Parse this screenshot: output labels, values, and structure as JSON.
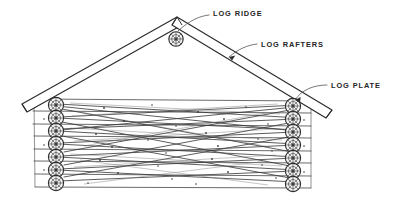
{
  "drawing": {
    "title": "Log cabin gable-end framing sketch",
    "style": "hand-drawn pencil line drawing",
    "background_color": "#ffffff",
    "ink_color": "#2b2b2b"
  },
  "annotations": [
    {
      "id": "log-ridge",
      "label": "LOG RIDGE",
      "text_x": 213,
      "text_y": 13,
      "leader": "M209,15 C200,16 190,20 178,30",
      "points_to": "ridge-log-end"
    },
    {
      "id": "log-rafters",
      "label": "LOG RAFTERS",
      "text_x": 261,
      "text_y": 44,
      "leader": "M257,44 C248,45 238,49 230,56",
      "points_to": "right-rafter",
      "arrow": {
        "x": 229,
        "y": 57,
        "angle": 35
      }
    },
    {
      "id": "log-plate",
      "label": "LOG PLATE",
      "text_x": 331,
      "text_y": 85,
      "leader": "M327,85 C315,85 303,89 296,99",
      "points_to": "right-plate-log-end",
      "arrow": {
        "x": 295,
        "y": 100,
        "angle": 60
      }
    }
  ],
  "structure": {
    "ridge": {
      "apex_x": 178,
      "apex_y": 22
    },
    "rafters": {
      "count": 2,
      "thickness": 9,
      "left_foot": {
        "x": 23,
        "y": 106
      },
      "right_foot": {
        "x": 333,
        "y": 118
      }
    },
    "wall": {
      "left_x": 33,
      "right_x": 311,
      "top_y": 98,
      "bottom_y": 188,
      "log_courses": 7
    },
    "log_ends": {
      "left_count": 7,
      "right_count": 7,
      "ridge_count": 1,
      "radius": 7.6,
      "left_x": 56,
      "right_x": 293,
      "top_y": 105,
      "spacing": 12.6
    }
  }
}
